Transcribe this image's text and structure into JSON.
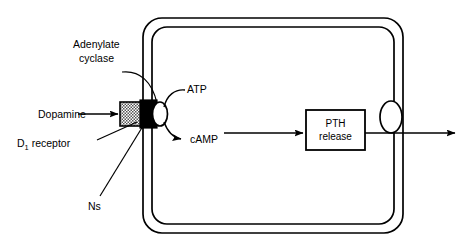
{
  "diagram": {
    "background_color": "#ffffff",
    "line_color": "#000000",
    "receptor_fill_color": "#a8a8a8",
    "g_protein_fill_color": "#000000",
    "cyclase_fill_color": "#ffffff",
    "labels": {
      "adenylate_cyclase_line1": "Adenylate",
      "adenylate_cyclase_line2": "cyclase",
      "dopamine": "Dopamine",
      "d1_receptor_main": "D",
      "d1_receptor_sub": "1",
      "d1_receptor_rest": " receptor",
      "ns": "Ns",
      "atp": "ATP",
      "camp": "cAMP",
      "pth_release_line1": "PTH",
      "pth_release_line2": "release"
    }
  }
}
